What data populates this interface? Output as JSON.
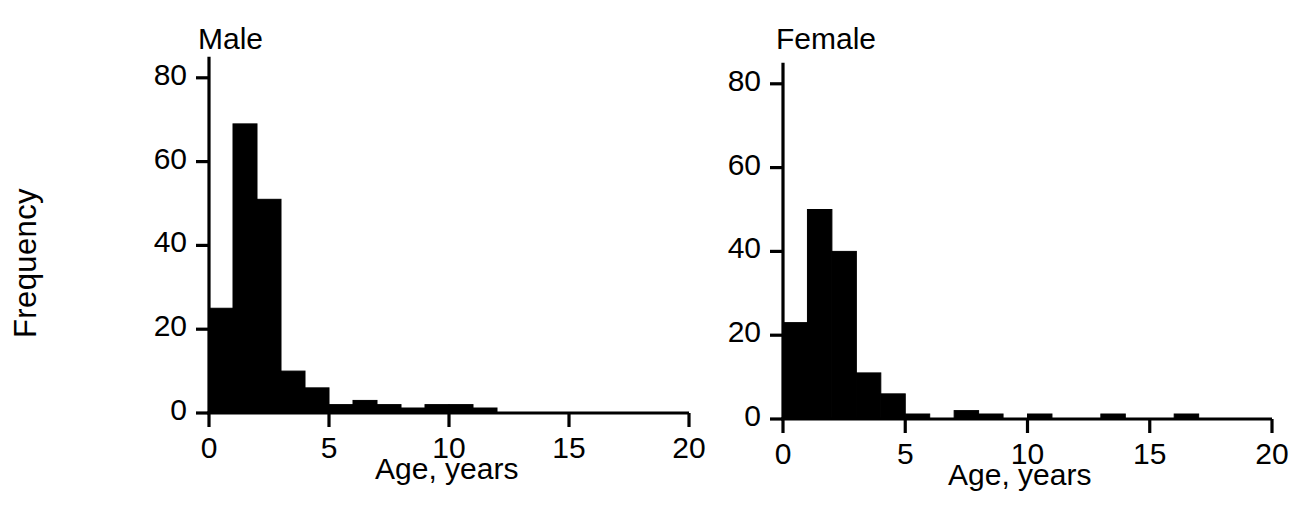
{
  "figure": {
    "shared_ylabel": "Frequency",
    "background": "#ffffff",
    "ink_color": "#000000"
  },
  "chart_data": [
    {
      "type": "bar",
      "title": "Male",
      "xlabel": "Age, years",
      "ylabel": "Frequency",
      "grid": false,
      "legend": "none",
      "xlim": [
        0,
        20
      ],
      "ylim": [
        0,
        85
      ],
      "xticks": [
        0,
        5,
        10,
        15,
        20
      ],
      "xtick_labels": [
        "0",
        "5",
        "10",
        "15",
        "20"
      ],
      "yticks": [
        0,
        20,
        40,
        60,
        80
      ],
      "ytick_labels": [
        "0",
        "20",
        "40",
        "60",
        "80"
      ],
      "bin_width": 1,
      "bin_starts": [
        0,
        1,
        2,
        3,
        4,
        5,
        6,
        7,
        8,
        9,
        10,
        11
      ],
      "categories": [
        "0-1",
        "1-2",
        "2-3",
        "3-4",
        "4-5",
        "5-6",
        "6-7",
        "7-8",
        "8-9",
        "9-10",
        "10-11",
        "11-12"
      ],
      "values": [
        25,
        69,
        51,
        10,
        6,
        2,
        3,
        2,
        1,
        2,
        2,
        1
      ]
    },
    {
      "type": "bar",
      "title": "Female",
      "xlabel": "Age, years",
      "ylabel": "Frequency",
      "grid": false,
      "legend": "none",
      "xlim": [
        0,
        20
      ],
      "ylim": [
        0,
        85
      ],
      "xticks": [
        0,
        5,
        10,
        15,
        20
      ],
      "xtick_labels": [
        "0",
        "5",
        "10",
        "15",
        "20"
      ],
      "yticks": [
        0,
        20,
        40,
        60,
        80
      ],
      "ytick_labels": [
        "0",
        "20",
        "40",
        "60",
        "80"
      ],
      "bin_width": 1,
      "bin_starts": [
        0,
        1,
        2,
        3,
        4,
        5,
        6,
        7,
        8,
        9,
        10,
        11,
        12,
        13,
        14,
        15,
        16
      ],
      "categories": [
        "0-1",
        "1-2",
        "2-3",
        "3-4",
        "4-5",
        "5-6",
        "6-7",
        "7-8",
        "8-9",
        "9-10",
        "10-11",
        "11-12",
        "12-13",
        "13-14",
        "14-15",
        "15-16",
        "16-17"
      ],
      "values": [
        23,
        50,
        40,
        11,
        6,
        1,
        0,
        2,
        1,
        0,
        1,
        0,
        0,
        1,
        0,
        0,
        1
      ]
    }
  ],
  "panels": {
    "male": {
      "title": "Male",
      "xlabel": "Age, years"
    },
    "female": {
      "title": "Female",
      "xlabel": "Age, years"
    }
  }
}
